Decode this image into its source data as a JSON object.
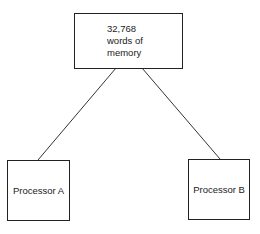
{
  "memory": {
    "line1": "32,768",
    "line2": "words of",
    "line3": "memory"
  },
  "processors": [
    {
      "label": "Processor A"
    },
    {
      "label": "Processor B"
    }
  ]
}
